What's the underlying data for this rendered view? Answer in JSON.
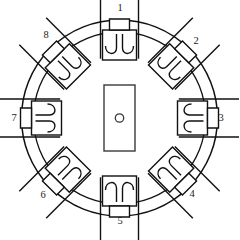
{
  "figure": {
    "background_color": "#ffffff",
    "line_color": "#111111",
    "width": 239,
    "height": 240
  },
  "geometry": {
    "center_x": 119.5,
    "center_y": 118,
    "outer_circle_radius": 98,
    "inner_circle_radius": 86,
    "hub": {
      "x": 104,
      "y": 85,
      "width": 31,
      "height": 66,
      "hole_radius": 4.2,
      "hole_cx": 119.5,
      "hole_cy": 118
    }
  },
  "callouts": [
    {
      "id": "1",
      "label": "1",
      "angle_deg": 90,
      "label_x": 120,
      "label_y": 9
    },
    {
      "id": "2",
      "label": "2",
      "angle_deg": 45,
      "label_x": 196,
      "label_y": 42
    },
    {
      "id": "3",
      "label": "3",
      "angle_deg": 0,
      "label_x": 221,
      "label_y": 119
    },
    {
      "id": "4",
      "label": "4",
      "angle_deg": -45,
      "label_x": 192,
      "label_y": 195
    },
    {
      "id": "5",
      "label": "5",
      "angle_deg": -90,
      "label_x": 120,
      "label_y": 222
    },
    {
      "id": "6",
      "label": "6",
      "angle_deg": -135,
      "label_x": 43,
      "label_y": 196
    },
    {
      "id": "7",
      "label": "7",
      "angle_deg": 180,
      "label_x": 14,
      "label_y": 119
    },
    {
      "id": "8",
      "label": "8",
      "angle_deg": 135,
      "label_x": 46,
      "label_y": 36
    }
  ],
  "clamp_count": 8,
  "clamp_description": "Eight identical bracket-and-hook clamp assemblies spaced at 45 degree intervals around the ring."
}
